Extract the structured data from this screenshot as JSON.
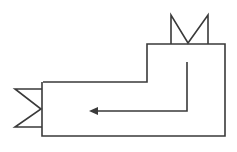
{
  "diagram": {
    "type": "duct-flow-schematic",
    "stroke_color": "#3a3a3a",
    "background": "#ffffff",
    "elements": [
      {
        "name": "l-shaped-duct",
        "description": "L-shaped enclosure outline"
      },
      {
        "name": "top-valve",
        "description": "M/bowtie valve symbol on top edge"
      },
      {
        "name": "left-valve",
        "description": "Sideways valve symbol on left edge"
      },
      {
        "name": "flow-arrow",
        "description": "Arrow going down then left indicating flow direction"
      }
    ]
  }
}
